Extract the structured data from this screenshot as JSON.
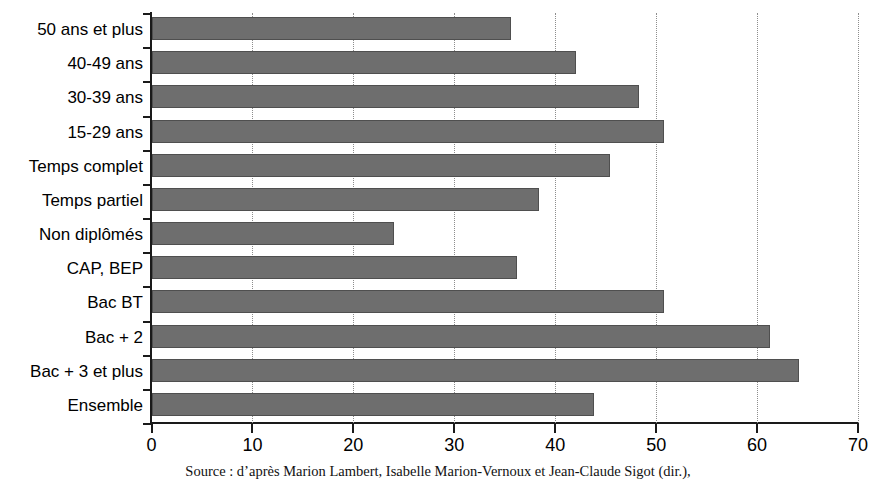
{
  "chart_data": {
    "type": "bar",
    "orientation": "horizontal",
    "title": "",
    "subtitle": "",
    "xlabel": "",
    "ylabel": "",
    "xlim": [
      0,
      70
    ],
    "xticks": [
      0,
      10,
      20,
      30,
      40,
      50,
      60,
      70
    ],
    "xtick_labels": [
      "0",
      "10",
      "20",
      "30",
      "40",
      "50",
      "60",
      "70"
    ],
    "grid": "vertical-dotted",
    "legend": "none",
    "bar_color": "#6e6e6e",
    "categories": [
      "50 ans et plus",
      "40-49 ans",
      "30-39 ans",
      "15-29 ans",
      "Temps complet",
      "Temps partiel",
      "Non diplômés",
      "CAP, BEP",
      "Bac BT",
      "Bac + 2",
      "Bac + 3 et plus",
      "Ensemble"
    ],
    "values": [
      35.6,
      42.1,
      48.3,
      50.8,
      45.4,
      38.4,
      24.0,
      36.2,
      50.8,
      61.3,
      64.2,
      43.8
    ]
  },
  "caption": {
    "source": "Source : d’après Marion Lambert, Isabelle Marion-Vernoux et Jean-Claude Sigot (dir.),"
  }
}
